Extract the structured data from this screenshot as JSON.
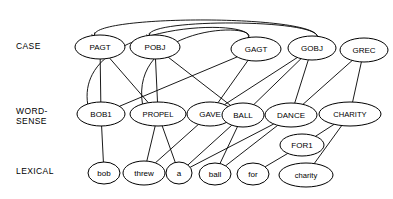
{
  "diagram": {
    "background_color": "#ffffff",
    "line_color": "#000000",
    "node_fill": "#ffffff",
    "row_labels": [
      {
        "id": "case",
        "text": "CASE",
        "x": 16,
        "y": 47,
        "lines": [
          "CASE"
        ]
      },
      {
        "id": "word-sense",
        "text": "WORD-SENSE",
        "x": 16,
        "y": 117,
        "lines": [
          "WORD-",
          "SENSE"
        ]
      },
      {
        "id": "lexical",
        "text": "LEXICAL",
        "x": 16,
        "y": 172,
        "lines": [
          "LEXICAL"
        ]
      }
    ],
    "nodes": [
      {
        "id": "PAGT",
        "label": "PAGT",
        "layer": "case",
        "cx": 100,
        "cy": 47,
        "rx": 25,
        "ry": 12
      },
      {
        "id": "POBJ",
        "label": "POBJ",
        "layer": "case",
        "cx": 155,
        "cy": 47,
        "rx": 25,
        "ry": 12
      },
      {
        "id": "GAGT",
        "label": "GAGT",
        "layer": "case",
        "cx": 256,
        "cy": 49,
        "rx": 25,
        "ry": 12
      },
      {
        "id": "GOBJ",
        "label": "GOBJ",
        "layer": "case",
        "cx": 312,
        "cy": 48,
        "rx": 24,
        "ry": 12
      },
      {
        "id": "GREC",
        "label": "GREC",
        "layer": "case",
        "cx": 364,
        "cy": 50,
        "rx": 24,
        "ry": 12
      },
      {
        "id": "BOB1",
        "label": "BOB1",
        "layer": "word-sense",
        "cx": 101,
        "cy": 114,
        "rx": 24,
        "ry": 12
      },
      {
        "id": "PROPEL",
        "label": "PROPEL",
        "layer": "word-sense",
        "cx": 158,
        "cy": 114,
        "rx": 28,
        "ry": 12
      },
      {
        "id": "GAVE",
        "label": "GAVE",
        "layer": "word-sense",
        "cx": 210,
        "cy": 114,
        "rx": 23,
        "ry": 12
      },
      {
        "id": "BALL",
        "label": "BALL",
        "layer": "word-sense",
        "cx": 243,
        "cy": 115,
        "rx": 21,
        "ry": 12
      },
      {
        "id": "DANCE",
        "label": "DANCE",
        "layer": "word-sense",
        "cx": 291,
        "cy": 115,
        "rx": 26,
        "ry": 12
      },
      {
        "id": "CHARITY",
        "label": "CHARITY",
        "layer": "word-sense",
        "cx": 350,
        "cy": 114,
        "rx": 31,
        "ry": 12
      },
      {
        "id": "FOR1",
        "label": "FOR1",
        "layer": "word-sense",
        "cx": 302,
        "cy": 145,
        "rx": 22,
        "ry": 11
      },
      {
        "id": "bob",
        "label": "bob",
        "layer": "lexical",
        "cx": 104,
        "cy": 173,
        "rx": 16,
        "ry": 11
      },
      {
        "id": "threw",
        "label": "threw",
        "layer": "lexical",
        "cx": 144,
        "cy": 173,
        "rx": 21,
        "ry": 12
      },
      {
        "id": "a",
        "label": "a",
        "layer": "lexical",
        "cx": 179,
        "cy": 173,
        "rx": 13,
        "ry": 11
      },
      {
        "id": "ball",
        "label": "ball",
        "layer": "lexical",
        "cx": 215,
        "cy": 174,
        "rx": 16,
        "ry": 11
      },
      {
        "id": "for",
        "label": "for",
        "layer": "lexical",
        "cx": 253,
        "cy": 174,
        "rx": 16,
        "ry": 11
      },
      {
        "id": "charity",
        "label": "charity",
        "layer": "lexical",
        "cx": 306,
        "cy": 175,
        "rx": 27,
        "ry": 12
      }
    ],
    "edges": [
      {
        "from": "PAGT",
        "to": "BOB1",
        "kind": "line"
      },
      {
        "from": "PAGT",
        "to": "PROPEL",
        "kind": "line"
      },
      {
        "from": "POBJ",
        "to": "PROPEL",
        "kind": "line"
      },
      {
        "from": "POBJ",
        "to": "BALL",
        "kind": "line"
      },
      {
        "from": "GAGT",
        "to": "GAVE",
        "kind": "line"
      },
      {
        "from": "GAGT",
        "to": "BOB1",
        "kind": "line"
      },
      {
        "from": "GOBJ",
        "to": "GAVE",
        "kind": "line"
      },
      {
        "from": "GOBJ",
        "to": "BALL",
        "kind": "line"
      },
      {
        "from": "GOBJ",
        "to": "DANCE",
        "kind": "line"
      },
      {
        "from": "GREC",
        "to": "CHARITY",
        "kind": "line"
      },
      {
        "from": "GREC",
        "to": "DANCE",
        "kind": "line"
      },
      {
        "from": "BOB1",
        "to": "bob",
        "kind": "line"
      },
      {
        "from": "PROPEL",
        "to": "threw",
        "kind": "line"
      },
      {
        "from": "PROPEL",
        "to": "a",
        "kind": "line"
      },
      {
        "from": "GAVE",
        "to": "threw",
        "kind": "line"
      },
      {
        "from": "BALL",
        "to": "ball",
        "kind": "line"
      },
      {
        "from": "BALL",
        "to": "a",
        "kind": "line"
      },
      {
        "from": "DANCE",
        "to": "ball",
        "kind": "line"
      },
      {
        "from": "DANCE",
        "to": "a",
        "kind": "line"
      },
      {
        "from": "FOR1",
        "to": "for",
        "kind": "line"
      },
      {
        "from": "CHARITY",
        "to": "charity",
        "kind": "line"
      },
      {
        "from": "CHARITY",
        "to": "FOR1",
        "kind": "line"
      },
      {
        "from": "BOB1",
        "to": "GAGT",
        "kind": "arc-over"
      },
      {
        "from": "PROPEL",
        "to": "GAGT",
        "kind": "arc-over"
      },
      {
        "from": "GOBJ",
        "to": "PAGT",
        "kind": "arc-over-arrow"
      },
      {
        "from": "GOBJ",
        "to": "POBJ",
        "kind": "arc-over-arrow"
      }
    ]
  }
}
